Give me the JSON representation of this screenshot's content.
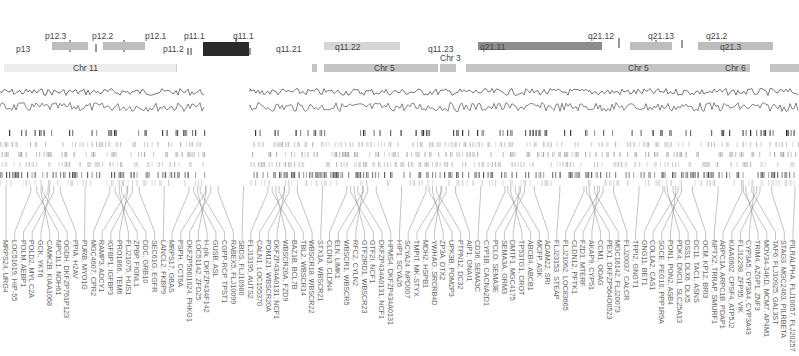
{
  "figure": {
    "ideogram": {
      "bands": [
        {
          "label": "p13",
          "x": 16,
          "y": 45,
          "box": null
        },
        {
          "label": "p12.3",
          "x": 45,
          "y": 32,
          "box": {
            "x": 52,
            "w": 36,
            "color": "#bdbdbd"
          }
        },
        {
          "label": "p12.2",
          "x": 92,
          "y": 32,
          "box": null
        },
        {
          "label": "p12.1",
          "x": 145,
          "y": 32,
          "box": {
            "x": 103,
            "w": 42,
            "color": "#bdbdbd"
          }
        },
        {
          "label": "p11.2",
          "x": 163,
          "y": 45,
          "box": null
        },
        {
          "label": "p11.1",
          "x": 184,
          "y": 32,
          "box": null
        },
        {
          "label": "q11.1",
          "x": 233,
          "y": 32,
          "box": {
            "x": 203,
            "w": 46,
            "color": "#2a2a2a"
          }
        },
        {
          "label": "q11.21",
          "x": 276,
          "y": 45,
          "box": null
        },
        {
          "label": "q11.22",
          "x": 335,
          "y": 45,
          "box": {
            "x": 324,
            "w": 76,
            "color": "#d6d6d6"
          }
        },
        {
          "label": "q11.23",
          "x": 428,
          "y": 45,
          "box": null
        },
        {
          "label": "q21.11",
          "x": 480,
          "y": 45,
          "box": {
            "x": 478,
            "w": 124,
            "color": "#8c8c8c"
          }
        },
        {
          "label": "q21.12",
          "x": 588,
          "y": 32,
          "box": null
        },
        {
          "label": "q21.13",
          "x": 648,
          "y": 32,
          "box": {
            "x": 630,
            "w": 42,
            "color": "#bdbdbd"
          }
        },
        {
          "label": "q21.2",
          "x": 706,
          "y": 32,
          "box": null
        },
        {
          "label": "q21.3",
          "x": 720,
          "y": 45,
          "box": {
            "x": 698,
            "w": 75,
            "color": "#bdbdbd"
          }
        }
      ]
    },
    "chromosome_track": {
      "segments": [
        {
          "label": "Chr 11",
          "x": 4,
          "w": 172,
          "label_x": 73
        },
        {
          "label": "",
          "x": 312,
          "w": 5,
          "label_x": null
        },
        {
          "label": "Chr 5",
          "x": 324,
          "w": 114,
          "label_x": 374
        },
        {
          "label": "Chr 3",
          "x": 440,
          "w": 16,
          "label_x": 440
        },
        {
          "label": "",
          "x": 466,
          "w": 64,
          "label_x": null
        },
        {
          "label": "Chr 5",
          "x": 530,
          "w": 220,
          "label_x": 628
        },
        {
          "label": "",
          "x": 683,
          "w": 16,
          "label_x": null
        },
        {
          "label": "Chr 6",
          "x": 696,
          "w": 0,
          "label_x": 725
        },
        {
          "label": "",
          "x": 770,
          "w": 29,
          "label_x": null
        }
      ]
    },
    "tracks": {
      "line_plots": [
        "GC content",
        "Repeat density"
      ],
      "heat_rows": 5
    },
    "genes": [
      "MRPS24, URG4",
      "LOC51619, HIP-55",
      "POLM, AEBP1",
      "POLD2, MYL C2A",
      "GCK, YKT6",
      "CAMK2B, KIAA1068",
      "NPC1L1, NOH61",
      "OGDH, DKFZP761P123",
      "PPIA, H2AV",
      "PURB, MYO1G",
      "MGC4607, CPR2",
      "RAMP3, ADCY1",
      "IGFBP1, IGFBP3",
      "PRO1866, TEM6",
      "FLJ21075, HUS1",
      "ZPBP, FIGNL1",
      "DDC, GRB10",
      "SEC61G, EGFR",
      "LANCL2, FKBP9",
      "MRPS17, GBAS",
      "PSPH, CCT6A",
      "DKFZP566I1024, PHKG1",
      "LOC51142, ZFD25",
      "H-plk, DKFZP434F142",
      "GUSB, ASL",
      "CGPP-RCP, TPST1",
      "RABEX5, FLJ10099",
      "SBDS, FLJ10980",
      "FLJ13195, AUTS2",
      "CALN1, LOC155370",
      "POM121, WBSCR20A",
      "DKFZP434A0131, NCF1",
      "WBSCR20A, FZD9",
      "BAZ1B, BCL7B",
      "TBL2, WBSCR14",
      "WBSCR18, WBSCR22",
      "STX1A, WBSCR21",
      "CLDN3, CLDN4",
      "ELN, LIMK1",
      "WBSCR1, WBSCR5",
      "RFC2, CYLN2",
      "GTF2IRD1, WBSCR23",
      "GTF2I, NCF1",
      "DKFZP434A0131, NCF1",
      "HPMS4, DKFZP434A0131",
      "HIP1, SCYA26",
      "SCYA24, NPD007",
      "TMPIT, MK-STYX",
      "MDH2, HSPB1",
      "YWHAG, SRCRB4D",
      "ZP3A, DTX2",
      "UPK3B, POM2P3",
      "PTPN12, DC32",
      "AIP1, GNAI1",
      "CD36, SEMA3C",
      "CYP1B, CACNA2D1",
      "PCLO, SEMA3E",
      "SEMA3A, GRM3",
      "DMTF1, MGC4175",
      "TP53TG1, CROT",
      "ABCB4, ABCB1",
      "MCFP, ASK",
      "ADAM22, SRI",
      "FLJ23153, STEAP",
      "FLJ21062, LOC83665",
      "CLDN12, PFTK1",
      "FZD1, MTERF",
      "AKAP9, CYP51",
      "CCM1, ODAG",
      "PEX1, DKFZP564O0523",
      "MGC16142, FLJ20073",
      "FLJ20037, CALCR",
      "TFPI2, GNGT1",
      "GNG11, BET1",
      "COL1A2, CAS1",
      "SGCE, PEG10, PPP1R9A",
      "PON1, PON2, ASB4",
      "PDK4, DNCI1, SLC25A13",
      "DSS1, DLX6, DLX5",
      "DC11, TAC1, ASNS",
      "OCM, KP12, BRI3",
      "NPTX2, TRRAP, SMURF1",
      "ARPC1A, ARPC1B, PDAP1",
      "KIAA0602, CPSF4, ATP5J2",
      "FLJ12298, ZFP95, VIK",
      "CYP3A5, CYP3A4, CYP3A43",
      "TRIM4, AZGP1, ZNF3",
      "MOV34-34KD, MCM7, AP4M1",
      "TAF6, FLJ10925, GAL3ST",
      "STAG3, MGC2463, PILRBETA",
      "PILRALPHA, FLJ10057, FLJ20257"
    ],
    "colors": {
      "band_dark": "#2a2a2a",
      "band_mid": "#8c8c8c",
      "band_light": "#bdbdbd",
      "chromosome": "#c4c4c4",
      "line": "#555555",
      "text": "#555555"
    }
  }
}
